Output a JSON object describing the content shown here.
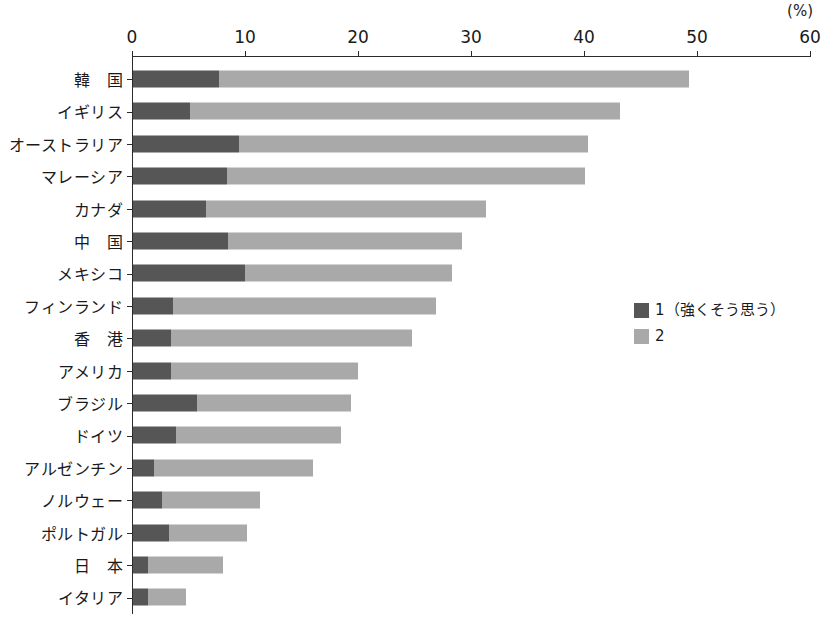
{
  "chart_data": {
    "type": "bar",
    "orientation": "horizontal",
    "stacked": true,
    "title": "",
    "subtitle": "",
    "xlabel": "",
    "ylabel": "",
    "unit_label": "(%)",
    "xlim": [
      0,
      60
    ],
    "xticks": [
      0,
      10,
      20,
      30,
      40,
      50,
      60
    ],
    "xtick_labels": [
      "0",
      "10",
      "20",
      "30",
      "40",
      "50",
      "60"
    ],
    "grid": false,
    "legend_position": "right-middle",
    "categories": [
      "韓　国",
      "イギリス",
      "オーストラリア",
      "マレーシア",
      "カナダ",
      "中　国",
      "メキシコ",
      "フィンランド",
      "香　港",
      "アメリカ",
      "ブラジル",
      "ドイツ",
      "アルゼンチン",
      "ノルウェー",
      "ポルトガル",
      "日　本",
      "イタリア"
    ],
    "series": [
      {
        "name": "1（強くそう思う）",
        "color": "#565656",
        "values": [
          7.6,
          5.0,
          9.4,
          8.3,
          6.5,
          8.4,
          9.9,
          3.5,
          3.4,
          3.4,
          5.7,
          3.8,
          1.9,
          2.6,
          3.2,
          1.3,
          1.3
        ]
      },
      {
        "name": "2",
        "color": "#a9a9a9",
        "values": [
          41.6,
          38.1,
          30.9,
          31.7,
          24.7,
          20.7,
          18.3,
          23.3,
          21.3,
          16.5,
          13.6,
          14.6,
          14.0,
          8.6,
          6.9,
          6.7,
          3.4
        ]
      }
    ],
    "totals": [
      49.2,
      43.1,
      40.3,
      40.0,
      31.2,
      29.1,
      28.2,
      26.8,
      24.7,
      19.9,
      19.3,
      18.4,
      15.9,
      11.2,
      10.1,
      8.0,
      4.7
    ]
  },
  "legend": {
    "items": [
      {
        "label": "1（強くそう思う）",
        "swatch": "dark-swatch-icon"
      },
      {
        "label": "2",
        "swatch": "light-swatch-icon"
      }
    ]
  }
}
